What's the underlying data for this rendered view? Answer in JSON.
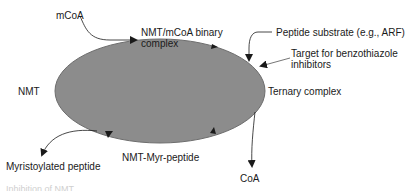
{
  "diagram": {
    "colors": {
      "ellipse_fill": "#8c8c8c",
      "ellipse_stroke": "#6e6e6e",
      "arrow": "#1a1a1a",
      "text": "#1a1a1a"
    },
    "labels": {
      "mcoa": "mCoA",
      "binary_complex_line1": "NMT/mCoA binary",
      "binary_complex_line2": "complex",
      "peptide_substrate": "Peptide substrate (e.g., ARF)",
      "target_line1": "Target for benzothiazole",
      "target_line2": "inhibitors",
      "nmt": "NMT",
      "ternary_complex": "Ternary complex",
      "myristoylated_peptide": "Myristoylated peptide",
      "nmt_myr_peptide": "NMT-Myr-peptide",
      "coa": "CoA"
    },
    "caption_partial": "Inhibition of NMT ..."
  }
}
